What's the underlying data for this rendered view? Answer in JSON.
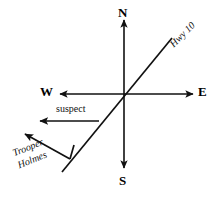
{
  "diagram": {
    "type": "compass-vector-diagram",
    "background_color": "#ffffff",
    "stroke_color": "#111111",
    "cardinals": {
      "north": "N",
      "south": "S",
      "east": "E",
      "west": "W"
    },
    "labels": {
      "highway": "Hwy 10",
      "suspect": "suspect",
      "trooper_line1": "Trooper",
      "trooper_line2": "Holmes"
    },
    "geometry": {
      "origin_x": 124,
      "origin_y": 94,
      "north_tip_y": 18,
      "south_tip_y": 170,
      "west_tip_x": 58,
      "east_tip_x": 195,
      "highway_upper_x": 172,
      "highway_upper_y": 38,
      "highway_lower_x": 62,
      "highway_lower_y": 172,
      "suspect_tail_x": 99,
      "suspect_tail_y": 121,
      "suspect_tip_x": 38,
      "suspect_tip_y": 121,
      "trooper_tail_x": 70,
      "trooper_tail_y": 159,
      "trooper_tip_x": 23,
      "trooper_tip_y": 133
    }
  }
}
